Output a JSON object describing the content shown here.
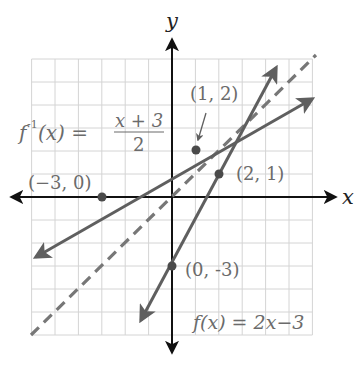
{
  "chart_data": {
    "type": "line",
    "title": "",
    "xlabel": "x",
    "ylabel": "y",
    "xlim": [
      -6,
      6
    ],
    "ylim": [
      -6,
      6
    ],
    "grid": true,
    "grid_step": 1,
    "series": [
      {
        "name": "f(x) = 2x−3",
        "equation": "y = 2x - 3",
        "style": "solid",
        "color": "#5f5f5f",
        "points": [
          [
            0,
            -3
          ],
          [
            2,
            1
          ]
        ],
        "x_range": [
          -1.4,
          4.5
        ]
      },
      {
        "name": "f^-1(x) = (x + 3)/2",
        "equation": "y = (x + 3) / 2",
        "style": "solid",
        "color": "#5f5f5f",
        "points": [
          [
            -3,
            0
          ],
          [
            1,
            2
          ]
        ],
        "x_range": [
          -5.9,
          6
        ]
      },
      {
        "name": "y = x",
        "equation": "y = x",
        "style": "dashed",
        "color": "#7a7a7a",
        "x_range": [
          -6,
          6
        ]
      }
    ],
    "labeled_points": [
      {
        "label": "(−3, 0)",
        "x": -3,
        "y": 0
      },
      {
        "label": "(1, 2)",
        "x": 1,
        "y": 2
      },
      {
        "label": "(2, 1)",
        "x": 2,
        "y": 1
      },
      {
        "label": "(0, -3)",
        "x": 0,
        "y": -3
      }
    ],
    "annotations": [
      {
        "text": "f⁻¹(x) = (x + 3)/2",
        "near": "upper-left"
      },
      {
        "text": "f(x) = 2x−3",
        "near": "lower-right"
      }
    ]
  },
  "labels": {
    "x_axis": "x",
    "y_axis": "y",
    "finv_lhs": "f",
    "finv_sup": "-1",
    "finv_arg": "(x) =",
    "finv_num": "x + 3",
    "finv_den": "2",
    "f_eq": "f(x) = 2x−3",
    "pt_m30": "(−3, 0)",
    "pt_12": "(1, 2)",
    "pt_21": "(2, 1)",
    "pt_0m3": "(0, -3)"
  },
  "colors": {
    "grid": "#d4d4d4",
    "axis": "#111111",
    "line": "#5f5f5f",
    "dashed": "#777777",
    "text": "#6b6b6b"
  }
}
